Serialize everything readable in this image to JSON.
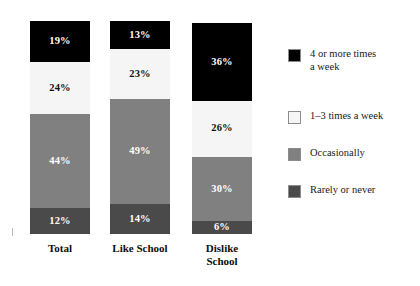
{
  "chart_data": {
    "type": "bar",
    "subtype": "stacked-bar-100",
    "title": "",
    "xlabel": "",
    "ylabel": "",
    "ylim": [
      0,
      100
    ],
    "grid": false,
    "legend_position": "right",
    "categories": [
      "Total",
      "Like School",
      "Dislike School"
    ],
    "category_labels_multiline": [
      "Total",
      "Like School",
      "Dislike\nSchool"
    ],
    "stack_order_top_to_bottom": [
      "4 or more times a week",
      "1–3 times a week",
      "Occasionally",
      "Rarely or never"
    ],
    "series": [
      {
        "name": "4 or more times a week",
        "color": "#000000",
        "values": [
          19,
          13,
          36
        ]
      },
      {
        "name": "1–3 times a week",
        "color": "#f5f5f5",
        "values": [
          24,
          23,
          26
        ]
      },
      {
        "name": "Occasionally",
        "color": "#808080",
        "values": [
          44,
          49,
          30
        ]
      },
      {
        "name": "Rarely or never",
        "color": "#4a4a4a",
        "values": [
          12,
          14,
          6
        ]
      }
    ],
    "value_labels": {
      "Total": [
        "19%",
        "24%",
        "44%",
        "12%"
      ],
      "Like School": [
        "13%",
        "23%",
        "49%",
        "14%"
      ],
      "Dislike School": [
        "36%",
        "26%",
        "30%",
        "6%"
      ]
    },
    "column_totals": [
      99,
      99,
      98
    ]
  },
  "legend": {
    "items": [
      {
        "label": "4 or more times\na week",
        "color": "#000000"
      },
      {
        "label": "1–3 times a week",
        "color": "#f5f5f5"
      },
      {
        "label": "Occasionally",
        "color": "#808080"
      },
      {
        "label": "Rarely or never",
        "color": "#4a4a4a"
      }
    ]
  }
}
